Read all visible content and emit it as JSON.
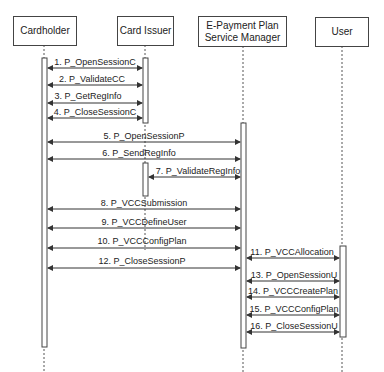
{
  "diagram": {
    "type": "sequence",
    "actors": [
      {
        "id": "cardholder",
        "label": "Cardholder"
      },
      {
        "id": "card_issuer",
        "label": "Card Issuer"
      },
      {
        "id": "epsm",
        "label": "E-Payment Plan Service Manager",
        "line1": "E-Payment Plan",
        "line2": "Service Manager"
      },
      {
        "id": "user",
        "label": "User"
      }
    ],
    "messages": [
      {
        "label": "1. P_OpenSessionC",
        "from": "Cardholder",
        "to": "Card Issuer"
      },
      {
        "label": "2. P_ValidateCC",
        "from": "Cardholder",
        "to": "Card Issuer"
      },
      {
        "label": "3. P_GetRegInfo",
        "from": "Cardholder",
        "to": "Card Issuer"
      },
      {
        "label": "4. P_CloseSessionC",
        "from": "Cardholder",
        "to": "Card Issuer"
      },
      {
        "label": "5. P_OpenSessionP",
        "from": "Cardholder",
        "to": "E-Payment Plan Service Manager"
      },
      {
        "label": "6. P_SendRegInfo",
        "from": "Cardholder",
        "to": "E-Payment Plan Service Manager"
      },
      {
        "label": "7. P_ValidateRegInfo",
        "from": "Card Issuer",
        "to": "E-Payment Plan Service Manager"
      },
      {
        "label": "8. P_VCCSubmission",
        "from": "Cardholder",
        "to": "E-Payment Plan Service Manager"
      },
      {
        "label": "9. P_VCCDefineUser",
        "from": "Cardholder",
        "to": "E-Payment Plan Service Manager"
      },
      {
        "label": "10. P_VCCConfigPlan",
        "from": "Cardholder",
        "to": "E-Payment Plan Service Manager"
      },
      {
        "label": "11. P_VCCAllocation",
        "from": "E-Payment Plan Service Manager",
        "to": "User"
      },
      {
        "label": "12. P_CloseSessionP",
        "from": "Cardholder",
        "to": "E-Payment Plan Service Manager"
      },
      {
        "label": "13. P_OpenSessionU",
        "from": "E-Payment Plan Service Manager",
        "to": "User"
      },
      {
        "label": "14. P_VCCCreatePlan",
        "from": "E-Payment Plan Service Manager",
        "to": "User"
      },
      {
        "label": "15. P_VCCConfigPlan",
        "from": "E-Payment Plan Service Manager",
        "to": "User"
      },
      {
        "label": "16. P_CloseSessionU",
        "from": "E-Payment Plan Service Manager",
        "to": "User"
      }
    ]
  }
}
